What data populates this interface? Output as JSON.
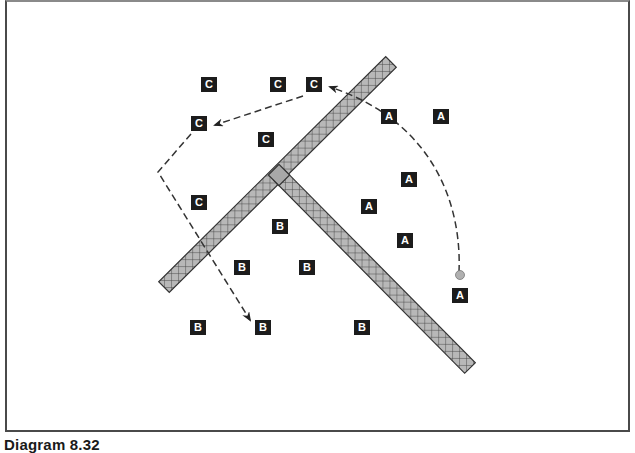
{
  "caption": "Diagram 8.32",
  "colors": {
    "frame": "#4a4a4a",
    "label_bg": "#1c1c1c",
    "label_fg": "#ffffff",
    "bar_fill": "#b3b3b3",
    "bar_outline": "#333333",
    "junction_fill": "#a8a8a8",
    "dashed_line": "#333333",
    "start_dot": "#b0b0b0"
  },
  "labels": [
    {
      "text": "C",
      "x": 209,
      "y": 84
    },
    {
      "text": "C",
      "x": 278,
      "y": 84
    },
    {
      "text": "C",
      "x": 314,
      "y": 84
    },
    {
      "text": "C",
      "x": 199,
      "y": 123
    },
    {
      "text": "C",
      "x": 266,
      "y": 139
    },
    {
      "text": "C",
      "x": 199,
      "y": 202
    },
    {
      "text": "A",
      "x": 389,
      "y": 116
    },
    {
      "text": "A",
      "x": 441,
      "y": 116
    },
    {
      "text": "A",
      "x": 409,
      "y": 179
    },
    {
      "text": "A",
      "x": 369,
      "y": 206
    },
    {
      "text": "A",
      "x": 405,
      "y": 240
    },
    {
      "text": "A",
      "x": 460,
      "y": 295
    },
    {
      "text": "B",
      "x": 280,
      "y": 226
    },
    {
      "text": "B",
      "x": 242,
      "y": 267
    },
    {
      "text": "B",
      "x": 307,
      "y": 267
    },
    {
      "text": "B",
      "x": 198,
      "y": 327
    },
    {
      "text": "B",
      "x": 263,
      "y": 327
    },
    {
      "text": "B",
      "x": 362,
      "y": 327
    }
  ],
  "bars": [
    {
      "name": "diagonal-bar-long",
      "x1": 164,
      "y1": 287,
      "x2": 391,
      "y2": 62,
      "width": 15
    },
    {
      "name": "diagonal-bar-short",
      "x1": 279,
      "y1": 175,
      "x2": 470,
      "y2": 368,
      "width": 15
    }
  ],
  "paths": [
    {
      "name": "curved-path-a-to-c",
      "d": "M 459 272 C 462 200, 430 120, 330 87"
    },
    {
      "name": "path-c-to-c",
      "d": "M 303 96 L 215 125"
    },
    {
      "name": "path-c-down-to-b",
      "d": "M 191 134 L 158 172 L 250 320"
    }
  ],
  "start_point": {
    "x": 460,
    "y": 275
  }
}
